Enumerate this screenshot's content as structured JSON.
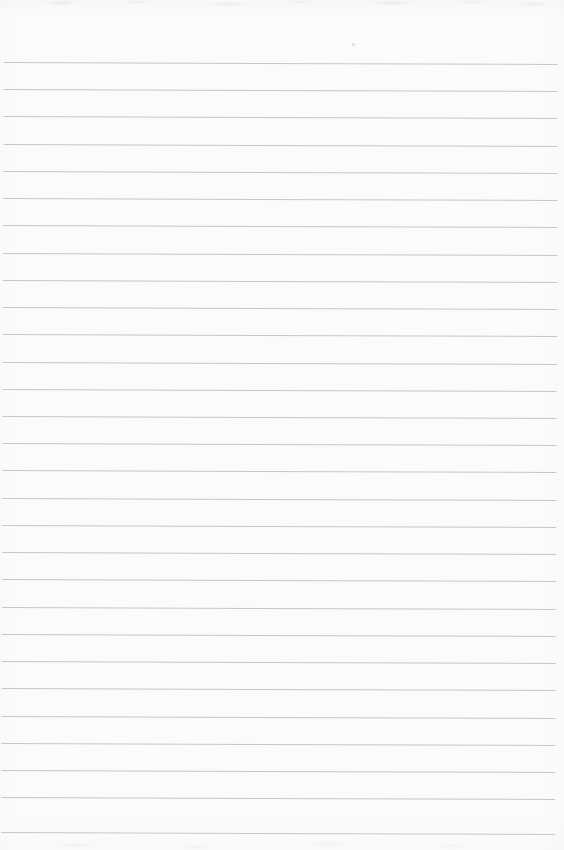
{
  "page": {
    "kind": "scanned-ruled-paper",
    "width": 564,
    "height": 850,
    "content_text": "",
    "background_color": "#fdfdfd",
    "paper_edge_tint": "#f8f9fa"
  },
  "rules": {
    "line_color": "#b9bec6",
    "line_thickness_px": 1,
    "line_opacity": 0.85,
    "spacing_px": 27.2,
    "first_line_y": 62,
    "last_line_y": 832,
    "line_start_x": 4,
    "line_end_x": 558,
    "line_count": 29,
    "skew_degrees": 0.2,
    "left_margin_px": 4,
    "right_margin_px": 6,
    "top_margin_px": 62,
    "bottom_margin_px": 18,
    "has_vertical_margin_rule": false,
    "lines": [
      {
        "index": 1,
        "y": 62
      },
      {
        "index": 2,
        "y": 89
      },
      {
        "index": 3,
        "y": 116
      },
      {
        "index": 4,
        "y": 144
      },
      {
        "index": 5,
        "y": 171
      },
      {
        "index": 6,
        "y": 198
      },
      {
        "index": 7,
        "y": 225
      },
      {
        "index": 8,
        "y": 253
      },
      {
        "index": 9,
        "y": 280
      },
      {
        "index": 10,
        "y": 307
      },
      {
        "index": 11,
        "y": 334
      },
      {
        "index": 12,
        "y": 362
      },
      {
        "index": 13,
        "y": 389
      },
      {
        "index": 14,
        "y": 416
      },
      {
        "index": 15,
        "y": 443
      },
      {
        "index": 16,
        "y": 470
      },
      {
        "index": 17,
        "y": 498
      },
      {
        "index": 18,
        "y": 525
      },
      {
        "index": 19,
        "y": 552
      },
      {
        "index": 20,
        "y": 579
      },
      {
        "index": 21,
        "y": 607
      },
      {
        "index": 22,
        "y": 634
      },
      {
        "index": 23,
        "y": 661
      },
      {
        "index": 24,
        "y": 688
      },
      {
        "index": 25,
        "y": 716
      },
      {
        "index": 26,
        "y": 743
      },
      {
        "index": 27,
        "y": 770
      },
      {
        "index": 28,
        "y": 797
      },
      {
        "index": 29,
        "y": 832
      }
    ]
  },
  "artifacts": {
    "speck": {
      "x": 352,
      "y": 43
    }
  }
}
